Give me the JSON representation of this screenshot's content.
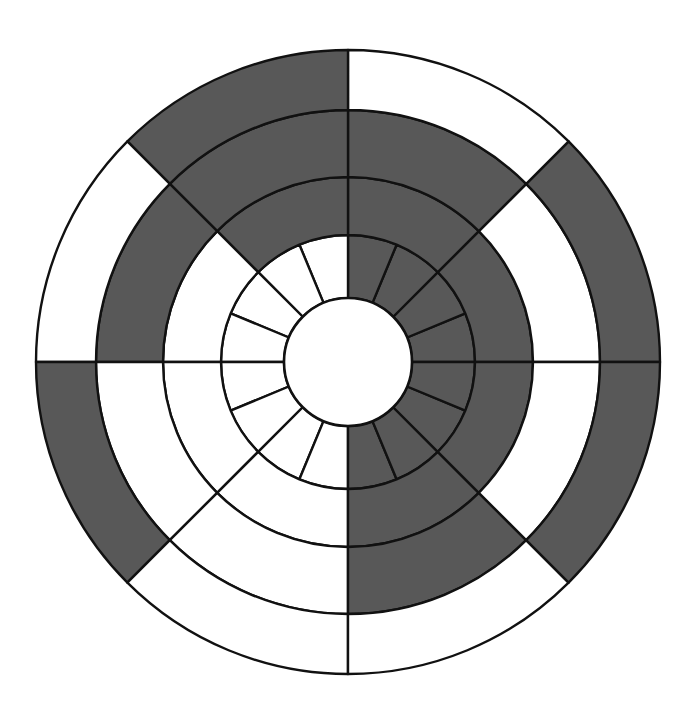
{
  "figure": {
    "background_color": "#ffffff",
    "shaded_color": "#585858",
    "plain_color": "#ffffff",
    "stroke_color": "#111111",
    "stroke_width": 2.4
  },
  "chart_data": {
    "type": "pie",
    "subtitle": "",
    "xlabel": "",
    "ylabel": "",
    "legend": [],
    "annotations": [],
    "grid": false,
    "geometry": {
      "center_x": 348,
      "center_y": 362,
      "hub_radius": 64,
      "ring_radii": [
        64,
        127,
        185,
        252,
        312
      ],
      "angle_origin_deg": 0,
      "angle_direction": "counterclockwise"
    },
    "categories": [
      "ring-1",
      "ring-2",
      "ring-3",
      "ring-4",
      "ring-5"
    ],
    "values": [
      16,
      8,
      8,
      8,
      8
    ],
    "series": [
      {
        "name": "ring-1",
        "inner_radius": 64,
        "outer_radius": 127,
        "sector_count": 16,
        "sector_span_deg": 22.5,
        "start_angle_deg": 0,
        "fills": [
          "shaded",
          "shaded",
          "shaded",
          "shaded",
          "plain",
          "plain",
          "plain",
          "plain",
          "plain",
          "plain",
          "plain",
          "plain",
          "shaded",
          "shaded",
          "shaded",
          "shaded"
        ]
      },
      {
        "name": "ring-2",
        "inner_radius": 127,
        "outer_radius": 185,
        "sector_count": 8,
        "sector_span_deg": 45,
        "start_angle_deg": 0,
        "fills": [
          "shaded",
          "shaded",
          "shaded",
          "plain",
          "plain",
          "plain",
          "shaded",
          "shaded"
        ]
      },
      {
        "name": "ring-3",
        "inner_radius": 185,
        "outer_radius": 252,
        "sector_count": 8,
        "sector_span_deg": 45,
        "start_angle_deg": 0,
        "fills": [
          "plain",
          "shaded",
          "shaded",
          "shaded",
          "plain",
          "plain",
          "shaded",
          "plain"
        ]
      },
      {
        "name": "ring-4",
        "inner_radius": 252,
        "outer_radius": 312,
        "sector_count": 8,
        "sector_span_deg": 45,
        "start_angle_deg": 0,
        "fills": [
          "shaded",
          "plain",
          "shaded",
          "plain",
          "shaded",
          "plain",
          "plain",
          "shaded"
        ]
      }
    ]
  }
}
